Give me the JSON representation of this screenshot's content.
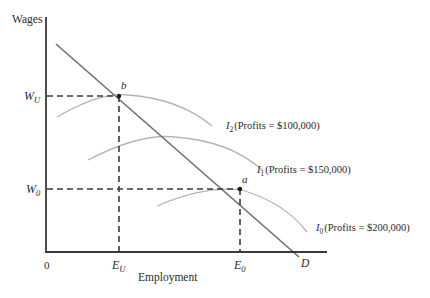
{
  "diagram": {
    "type": "economics-indifference-curves",
    "y_axis_label": "Wages",
    "x_axis_label": "Employment",
    "origin_label": "0",
    "y_ticks": [
      {
        "symbol": "W",
        "subscript": "U",
        "y": 96
      },
      {
        "symbol": "W",
        "subscript": "0",
        "y": 189
      }
    ],
    "x_ticks": [
      {
        "symbol": "E",
        "subscript": "U",
        "x": 119
      },
      {
        "symbol": "E",
        "subscript": "0",
        "x": 240
      }
    ],
    "points": [
      {
        "label": "b",
        "x": 119,
        "y": 96
      },
      {
        "label": "a",
        "x": 240,
        "y": 189
      }
    ],
    "demand_curve": {
      "label": "D"
    },
    "indifference_curves": [
      {
        "symbol": "I",
        "subscript": "2",
        "text": "(Profits = $100,000)"
      },
      {
        "symbol": "I",
        "subscript": "1",
        "text": "(Profits = $150,000)"
      },
      {
        "symbol": "I",
        "subscript": "0",
        "text": "(Profits = $200,000)"
      }
    ],
    "colors": {
      "axis": "#3a3a3a",
      "demand": "#6e6e6e",
      "indifference": "#b4b4b4",
      "dashed": "#3a3a3a"
    }
  }
}
